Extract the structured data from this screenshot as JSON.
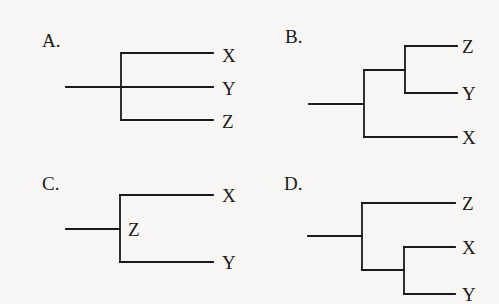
{
  "figure": {
    "background_color": "#f7f6f4",
    "line_color": "#1a1a1a"
  },
  "panels": [
    {
      "id": "A",
      "label": "A.",
      "topology": "polytomy (X, Y, Z)",
      "leaves": [
        {
          "name": "X",
          "x": 222,
          "y": 62
        },
        {
          "name": "Y",
          "x": 222,
          "y": 95
        },
        {
          "name": "Z",
          "x": 222,
          "y": 128
        }
      ],
      "label_pos": {
        "x": 42,
        "y": 47
      },
      "edges": [
        [
          66,
          87,
          213,
          87
        ],
        [
          121,
          53,
          121,
          120
        ],
        [
          121,
          53,
          213,
          53
        ],
        [
          121,
          120,
          213,
          120
        ]
      ]
    },
    {
      "id": "B",
      "label": "B.",
      "topology": "((Z, Y), X)",
      "leaves": [
        {
          "name": "Z",
          "x": 462,
          "y": 53
        },
        {
          "name": "Y",
          "x": 462,
          "y": 100
        },
        {
          "name": "X",
          "x": 462,
          "y": 144
        }
      ],
      "label_pos": {
        "x": 285,
        "y": 43
      },
      "edges": [
        [
          309,
          104,
          364,
          104
        ],
        [
          364,
          70,
          364,
          137
        ],
        [
          364,
          70,
          405,
          70
        ],
        [
          405,
          46,
          405,
          93
        ],
        [
          405,
          46,
          457,
          46
        ],
        [
          405,
          93,
          457,
          93
        ],
        [
          364,
          137,
          457,
          137
        ]
      ]
    },
    {
      "id": "C",
      "label": "C.",
      "topology": "Z as ancestor of (X, Y)",
      "leaves": [
        {
          "name": "X",
          "x": 222,
          "y": 202
        },
        {
          "name": "Y",
          "x": 222,
          "y": 269
        }
      ],
      "internal_node_label": {
        "name": "Z",
        "x": 128,
        "y": 236
      },
      "label_pos": {
        "x": 42,
        "y": 190
      },
      "edges": [
        [
          66,
          229,
          120,
          229
        ],
        [
          120,
          195,
          120,
          262
        ],
        [
          120,
          195,
          213,
          195
        ],
        [
          120,
          262,
          213,
          262
        ]
      ]
    },
    {
      "id": "D",
      "label": "D.",
      "topology": "(Z, (X, Y))",
      "leaves": [
        {
          "name": "Z",
          "x": 462,
          "y": 210
        },
        {
          "name": "X",
          "x": 462,
          "y": 254
        },
        {
          "name": "Y",
          "x": 462,
          "y": 301
        }
      ],
      "label_pos": {
        "x": 284,
        "y": 190
      },
      "edges": [
        [
          308,
          236,
          362,
          236
        ],
        [
          362,
          203,
          362,
          270
        ],
        [
          362,
          203,
          455,
          203
        ],
        [
          362,
          270,
          404,
          270
        ],
        [
          404,
          247,
          404,
          294
        ],
        [
          404,
          247,
          455,
          247
        ],
        [
          404,
          294,
          455,
          294
        ]
      ]
    }
  ]
}
